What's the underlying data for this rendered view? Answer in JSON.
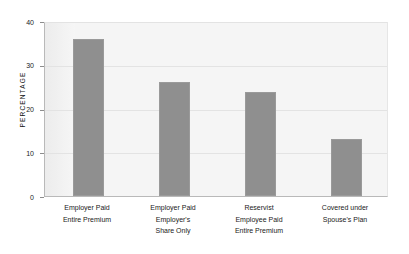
{
  "chart_data": {
    "type": "bar",
    "title": "",
    "subtitle": "",
    "xlabel": "",
    "ylabel": "PERCENTAGE",
    "ylim": [
      0,
      40
    ],
    "yticks": [
      "0",
      "10",
      "20",
      "30",
      "40"
    ],
    "grid": true,
    "legend": "none",
    "bar_color": "#8f8f8f",
    "plot_background": "#f5f5f5",
    "categories": [
      "Employer Paid Entire Premium",
      "Employer Paid Employer's Share Only",
      "Reservist Employee Paid Entire Premium",
      "Covered under Spouse's Plan"
    ],
    "category_lines": [
      [
        "Employer Paid",
        "Entire Premium"
      ],
      [
        "Employer Paid",
        "Employer's",
        "Share Only"
      ],
      [
        "Reservist",
        "Employee Paid",
        "Entire Premium"
      ],
      [
        "Covered under",
        "Spouse's Plan"
      ]
    ],
    "values": [
      35.8,
      26.0,
      23.8,
      13.0
    ]
  }
}
